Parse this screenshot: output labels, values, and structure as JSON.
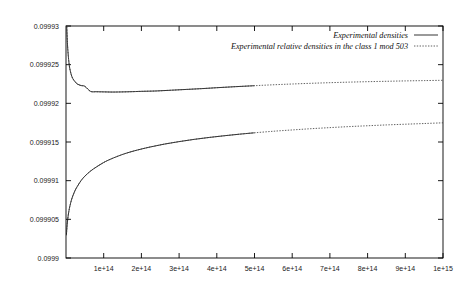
{
  "chart_data": {
    "type": "line",
    "title": "",
    "subtitle": "",
    "xlabel": "",
    "ylabel": "",
    "xlim": [
      0,
      1000000000000000.0
    ],
    "ylim": [
      0.0999,
      0.09993
    ],
    "grid": false,
    "legend_position": "top-right",
    "x_ticks": [
      {
        "value": 100000000000000.0,
        "label": "1e+14"
      },
      {
        "value": 200000000000000.0,
        "label": "2e+14"
      },
      {
        "value": 300000000000000.0,
        "label": "3e+14"
      },
      {
        "value": 400000000000000.0,
        "label": "4e+14"
      },
      {
        "value": 500000000000000.0,
        "label": "5e+14"
      },
      {
        "value": 600000000000000.0,
        "label": "6e+14"
      },
      {
        "value": 700000000000000.0,
        "label": "7e+14"
      },
      {
        "value": 800000000000000.0,
        "label": "8e+14"
      },
      {
        "value": 900000000000000.0,
        "label": "9e+14"
      },
      {
        "value": 1000000000000000.0,
        "label": "1e+15"
      }
    ],
    "y_ticks": [
      {
        "value": 0.0999,
        "label": "0.0999"
      },
      {
        "value": 0.099905,
        "label": "0.099905"
      },
      {
        "value": 0.09991,
        "label": "0.09991"
      },
      {
        "value": 0.099915,
        "label": "0.099915"
      },
      {
        "value": 0.09992,
        "label": "0.09992"
      },
      {
        "value": 0.099925,
        "label": "0.099925"
      },
      {
        "value": 0.09993,
        "label": "0.09993"
      }
    ],
    "series": [
      {
        "name": "Experimental densities",
        "style": "solid",
        "color": "#111111",
        "x": [
          2000000000000.0,
          4000000000000.0,
          6000000000000.0,
          8000000000000.0,
          10000000000000.0,
          14000000000000.0,
          18000000000000.0,
          24000000000000.0,
          30000000000000.0,
          40000000000000.0,
          50000000000000.0,
          65000000000000.0,
          80000000000000.0,
          100000000000000.0,
          120000000000000.0,
          140000000000000.0,
          170000000000000.0,
          200000000000000.0,
          240000000000000.0,
          280000000000000.0,
          320000000000000.0,
          360000000000000.0,
          400000000000000.0,
          440000000000000.0,
          480000000000000.0,
          500000000000000.0
        ],
        "y": [
          0.0999299,
          0.0999276,
          0.0999262,
          0.0999252,
          0.0999245,
          0.0999237,
          0.0999232,
          0.0999228,
          0.0999225,
          0.0999223,
          0.0999222,
          0.09992155,
          0.0999215,
          0.09992148,
          0.09992146,
          0.09992147,
          0.0999215,
          0.09992155,
          0.0999216,
          0.0999217,
          0.0999218,
          0.0999219,
          0.09992202,
          0.09992213,
          0.09992223,
          0.09992228
        ]
      },
      {
        "name": "Experimental relative densities in the class 1 mod 503",
        "style": "dashed",
        "color": "#3a3a3a",
        "x": [
          2000000000000.0,
          4000000000000.0,
          6000000000000.0,
          8000000000000.0,
          10000000000000.0,
          14000000000000.0,
          18000000000000.0,
          24000000000000.0,
          30000000000000.0,
          40000000000000.0,
          50000000000000.0,
          65000000000000.0,
          80000000000000.0,
          100000000000000.0,
          120000000000000.0,
          140000000000000.0,
          170000000000000.0,
          200000000000000.0,
          240000000000000.0,
          280000000000000.0,
          320000000000000.0,
          360000000000000.0,
          400000000000000.0,
          440000000000000.0,
          480000000000000.0,
          520000000000000.0,
          560000000000000.0,
          600000000000000.0,
          650000000000000.0,
          700000000000000.0,
          750000000000000.0,
          800000000000000.0,
          850000000000000.0,
          900000000000000.0,
          950000000000000.0,
          1000000000000000.0
        ],
        "y": [
          0.0999299,
          0.0999276,
          0.0999262,
          0.0999252,
          0.0999245,
          0.0999237,
          0.0999232,
          0.0999228,
          0.0999225,
          0.0999223,
          0.0999222,
          0.09992155,
          0.0999215,
          0.09992148,
          0.09992146,
          0.09992147,
          0.0999215,
          0.09992155,
          0.0999216,
          0.0999217,
          0.0999218,
          0.0999219,
          0.09992202,
          0.09992213,
          0.09992223,
          0.09992233,
          0.09992242,
          0.0999225,
          0.09992259,
          0.09992267,
          0.09992274,
          0.0999228,
          0.09992285,
          0.0999229,
          0.09992294,
          0.09992298
        ]
      },
      {
        "name": "Experimental densities",
        "style": "solid",
        "color": "#111111",
        "x": [
          1000000000000.0,
          2000000000000.0,
          3000000000000.0,
          4000000000000.0,
          6000000000000.0,
          8000000000000.0,
          10000000000000.0,
          14000000000000.0,
          18000000000000.0,
          24000000000000.0,
          30000000000000.0,
          40000000000000.0,
          50000000000000.0,
          65000000000000.0,
          80000000000000.0,
          100000000000000.0,
          120000000000000.0,
          150000000000000.0,
          180000000000000.0,
          220000000000000.0,
          260000000000000.0,
          300000000000000.0,
          340000000000000.0,
          380000000000000.0,
          420000000000000.0,
          460000000000000.0,
          500000000000000.0
        ],
        "y": [
          0.09990295,
          0.09990365,
          0.09990425,
          0.09990478,
          0.09990555,
          0.09990615,
          0.09990665,
          0.09990742,
          0.09990802,
          0.09990872,
          0.09990925,
          0.09991001,
          0.09991058,
          0.09991124,
          0.09991175,
          0.09991235,
          0.09991282,
          0.09991339,
          0.09991384,
          0.09991432,
          0.09991472,
          0.09991505,
          0.09991534,
          0.09991559,
          0.09991581,
          0.09991601,
          0.09991619
        ]
      },
      {
        "name": "Experimental relative densities in the class 1 mod 503",
        "style": "dashed",
        "color": "#3a3a3a",
        "x": [
          1000000000000.0,
          2000000000000.0,
          3000000000000.0,
          4000000000000.0,
          6000000000000.0,
          8000000000000.0,
          10000000000000.0,
          14000000000000.0,
          18000000000000.0,
          24000000000000.0,
          30000000000000.0,
          40000000000000.0,
          50000000000000.0,
          65000000000000.0,
          80000000000000.0,
          100000000000000.0,
          120000000000000.0,
          150000000000000.0,
          180000000000000.0,
          220000000000000.0,
          260000000000000.0,
          300000000000000.0,
          340000000000000.0,
          380000000000000.0,
          420000000000000.0,
          460000000000000.0,
          500000000000000.0,
          550000000000000.0,
          600000000000000.0,
          650000000000000.0,
          700000000000000.0,
          750000000000000.0,
          800000000000000.0,
          850000000000000.0,
          900000000000000.0,
          950000000000000.0,
          1000000000000000.0
        ],
        "y": [
          0.09990295,
          0.09990365,
          0.09990425,
          0.09990478,
          0.09990555,
          0.09990615,
          0.09990665,
          0.09990742,
          0.09990802,
          0.09990872,
          0.09990925,
          0.09991001,
          0.09991058,
          0.09991124,
          0.09991175,
          0.09991235,
          0.09991282,
          0.09991339,
          0.09991384,
          0.09991432,
          0.09991472,
          0.09991505,
          0.09991534,
          0.09991559,
          0.09991581,
          0.09991601,
          0.09991619,
          0.09991639,
          0.09991656,
          0.09991672,
          0.09991686,
          0.09991699,
          0.0999171,
          0.09991721,
          0.0999173,
          0.09991739,
          0.09991748
        ]
      }
    ],
    "legend": [
      {
        "label": "Experimental densities",
        "style": "solid"
      },
      {
        "label": "Experimental relative densities in the class 1 mod 503",
        "style": "dashed"
      }
    ]
  }
}
